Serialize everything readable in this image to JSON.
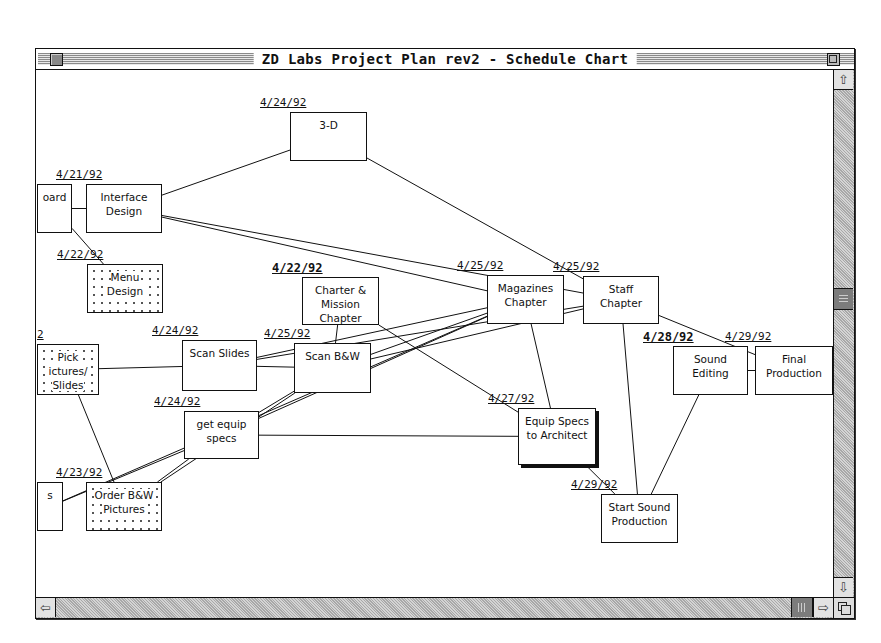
{
  "window": {
    "title": "ZD Labs Project Plan rev2 - Schedule Chart"
  },
  "scrollbars": {
    "vertical": {
      "up_icon": "arrow-up-icon",
      "down_icon": "arrow-down-icon"
    },
    "horizontal": {
      "left_icon": "arrow-left-icon",
      "right_icon": "arrow-right-icon"
    }
  },
  "tasks": [
    {
      "id": "board",
      "label": "oard",
      "date": "",
      "x": 1,
      "y": 114,
      "w": 35,
      "h": 49,
      "style": "plain"
    },
    {
      "id": "interface-design",
      "label": "Interface\nDesign",
      "date": "4/21/92",
      "date_bold": false,
      "x": 50,
      "y": 114,
      "w": 76,
      "h": 49,
      "style": "plain"
    },
    {
      "id": "3d",
      "label": "3-D",
      "date": "4/24/92",
      "date_bold": false,
      "x": 254,
      "y": 42,
      "w": 77,
      "h": 49,
      "style": "plain"
    },
    {
      "id": "menu-design",
      "label": "Menu\nDesign",
      "date": "4/22/92",
      "date_bold": false,
      "x": 51,
      "y": 194,
      "w": 76,
      "h": 49,
      "style": "dotted"
    },
    {
      "id": "charter-mission",
      "label": "Charter &\nMission\nChapter",
      "date": "4/22/92",
      "date_bold": true,
      "x": 266,
      "y": 207,
      "w": 77,
      "h": 48,
      "style": "plain"
    },
    {
      "id": "magazines-chapter",
      "label": "Magazines\nChapter",
      "date": "4/25/92",
      "date_bold": false,
      "x": 451,
      "y": 205,
      "w": 77,
      "h": 49,
      "style": "plain"
    },
    {
      "id": "staff-chapter",
      "label": "Staff\nChapter",
      "date": "4/25/92",
      "date_bold": false,
      "x": 547,
      "y": 206,
      "w": 76,
      "h": 48,
      "style": "plain"
    },
    {
      "id": "pick-pictures",
      "label": " Pick\nictures/\n Slides",
      "date": "2",
      "date_bold": false,
      "x": 1,
      "y": 274,
      "w": 62,
      "h": 51,
      "style": "dotted"
    },
    {
      "id": "scan-slides",
      "label": "Scan Slides",
      "date": "4/24/92",
      "date_bold": false,
      "x": 146,
      "y": 270,
      "w": 75,
      "h": 51,
      "style": "plain"
    },
    {
      "id": "scan-bw",
      "label": "Scan B&W",
      "date": "4/25/92",
      "date_bold": false,
      "x": 258,
      "y": 273,
      "w": 77,
      "h": 50,
      "style": "plain"
    },
    {
      "id": "get-equip-specs",
      "label": "get equip\nspecs",
      "date": "4/24/92",
      "date_bold": false,
      "x": 148,
      "y": 341,
      "w": 75,
      "h": 48,
      "style": "plain"
    },
    {
      "id": "equip-specs-architect",
      "label": "Equip Specs\nto Architect",
      "date": "4/27/92",
      "date_bold": false,
      "x": 482,
      "y": 338,
      "w": 78,
      "h": 57,
      "style": "shadow"
    },
    {
      "id": "sound-editing",
      "label": "Sound\nEditing",
      "date": "4/28/92",
      "date_bold": true,
      "x": 637,
      "y": 276,
      "w": 75,
      "h": 49,
      "style": "plain"
    },
    {
      "id": "final-production",
      "label": "Final\nProduction",
      "date": "4/29/92",
      "date_bold": false,
      "x": 719,
      "y": 276,
      "w": 78,
      "h": 49,
      "style": "plain"
    },
    {
      "id": "s-box",
      "label": "s",
      "date": "",
      "x": 1,
      "y": 412,
      "w": 26,
      "h": 49,
      "style": "plain"
    },
    {
      "id": "order-bw-pictures",
      "label": "Order B&W\nPictures",
      "date": "4/23/92",
      "date_bold": false,
      "x": 50,
      "y": 412,
      "w": 76,
      "h": 49,
      "style": "dotted"
    },
    {
      "id": "start-sound-production",
      "label": "Start Sound\nProduction",
      "date": "4/29/92",
      "date_bold": false,
      "x": 565,
      "y": 424,
      "w": 77,
      "h": 49,
      "style": "plain"
    }
  ],
  "links": [
    [
      "board",
      "interface-design"
    ],
    [
      "interface-design",
      "3d"
    ],
    [
      "interface-design",
      "magazines-chapter"
    ],
    [
      "interface-design",
      "staff-chapter"
    ],
    [
      "3d",
      "staff-chapter"
    ],
    [
      "board",
      "menu-design"
    ],
    [
      "charter-mission",
      "scan-bw"
    ],
    [
      "charter-mission",
      "equip-specs-architect"
    ],
    [
      "pick-pictures",
      "scan-slides"
    ],
    [
      "pick-pictures",
      "order-bw-pictures"
    ],
    [
      "scan-slides",
      "scan-bw"
    ],
    [
      "scan-slides",
      "magazines-chapter"
    ],
    [
      "scan-slides",
      "staff-chapter"
    ],
    [
      "scan-bw",
      "magazines-chapter"
    ],
    [
      "scan-bw",
      "staff-chapter"
    ],
    [
      "get-equip-specs",
      "scan-bw"
    ],
    [
      "get-equip-specs",
      "magazines-chapter"
    ],
    [
      "get-equip-specs",
      "equip-specs-architect"
    ],
    [
      "order-bw-pictures",
      "scan-bw"
    ],
    [
      "order-bw-pictures",
      "get-equip-specs"
    ],
    [
      "s-box",
      "get-equip-specs"
    ],
    [
      "s-box",
      "magazines-chapter"
    ],
    [
      "magazines-chapter",
      "equip-specs-architect"
    ],
    [
      "staff-chapter",
      "start-sound-production"
    ],
    [
      "staff-chapter",
      "final-production"
    ],
    [
      "equip-specs-architect",
      "start-sound-production"
    ],
    [
      "sound-editing",
      "start-sound-production"
    ],
    [
      "sound-editing",
      "final-production"
    ]
  ]
}
